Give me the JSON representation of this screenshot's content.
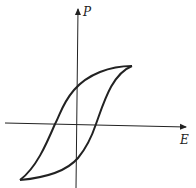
{
  "diagram": {
    "axes": {
      "x_label": "E",
      "y_label": "P"
    },
    "colors": {
      "line": "#222222",
      "background": "#ffffff"
    }
  }
}
